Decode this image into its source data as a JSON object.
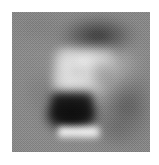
{
  "canvas": {
    "width_px": 159,
    "height_px": 165,
    "background_color": "#ffffff",
    "alt_text": "Low-resolution grainy grayscale image patch"
  },
  "image_panel": {
    "name": "grayscale-image-patch",
    "left_px": 12,
    "top_px": 12,
    "width_px": 138,
    "height_px": 140,
    "colorspace": "grayscale",
    "mean_background_gray": "#8a8a8a",
    "darkest_gray": "#0e0e0e",
    "brightest_gray": "#fdfdfd",
    "texture": "heavy pixel-level noise / film grain",
    "caption": ""
  },
  "features": [
    {
      "name": "top-dark-arc",
      "description": "dark horizontal arc across the upper portion",
      "gray": "#2a2a2a",
      "center_pct": {
        "x": 62,
        "y": 17
      }
    },
    {
      "name": "bright-plateau",
      "description": "bright plateau forming the top of a C-shaped highlight",
      "gray": "#e8e8e8",
      "center_pct": {
        "x": 53,
        "y": 34
      }
    },
    {
      "name": "bright-crescent",
      "description": "bright crescent on the left flank of the C highlight",
      "gray": "#efefef",
      "center_pct": {
        "x": 38,
        "y": 43
      }
    },
    {
      "name": "bright-midband",
      "description": "bright mid band of the C highlight",
      "gray": "#eeeeee",
      "center_pct": {
        "x": 47,
        "y": 49
      }
    },
    {
      "name": "notch-right",
      "description": "darker wedge notching the highlight from the right",
      "gray": "#787878",
      "center_pct": {
        "x": 67,
        "y": 45
      }
    },
    {
      "name": "dark-rect-blob",
      "description": "strong dark rectangular blob below the highlight",
      "gray": "#0e0e0e",
      "center_pct": {
        "x": 43,
        "y": 68
      }
    },
    {
      "name": "bright-bar",
      "description": "bright horizontal bar beneath the dark blob",
      "gray": "#fdfdfd",
      "center_pct": {
        "x": 48,
        "y": 86
      }
    },
    {
      "name": "right-shadow",
      "description": "broad shadow along the right flank, lower half",
      "gray": "#373737",
      "center_pct": {
        "x": 83,
        "y": 66
      }
    },
    {
      "name": "left-shadow",
      "description": "faint shadow along the left mid flank",
      "gray": "#5f5f5f",
      "center_pct": {
        "x": 22,
        "y": 58
      }
    },
    {
      "name": "corner-smudge-bottom-right",
      "description": "faint dark smudge near the bottom-right",
      "gray": "#555555",
      "center_pct": {
        "x": 75,
        "y": 86
      }
    },
    {
      "name": "corner-smudge-top-left",
      "description": "faint dark smudge near the top-left",
      "gray": "#6e6e6e",
      "center_pct": {
        "x": 19,
        "y": 11
      }
    }
  ]
}
